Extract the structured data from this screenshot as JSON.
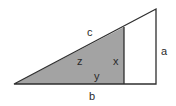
{
  "diagram": {
    "type": "right-triangle-similar",
    "labels": {
      "hypotenuse": "c",
      "height": "a",
      "base": "b",
      "inner_height": "x",
      "inner_base": "y",
      "inner_hypotenuse": "z"
    },
    "colors": {
      "shaded": "#a3a3a3",
      "stroke": "#2f2f2f",
      "background": "#ffffff"
    }
  }
}
